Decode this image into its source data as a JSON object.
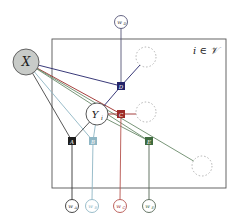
{
  "diagram": {
    "type": "factor-graph",
    "plate": {
      "label": "i ∈ 𝒱",
      "x": 52,
      "y": 39,
      "w": 174,
      "h": 149
    },
    "global_node": {
      "id": "X",
      "label": "X",
      "cx": 26,
      "cy": 62,
      "r": 13,
      "fill": "#c8cbc8"
    },
    "latent_node": {
      "id": "Y_i",
      "label": "Y",
      "sub": "i",
      "cx": 97,
      "cy": 114,
      "r": 11
    },
    "factors": [
      {
        "id": "f_A",
        "label": "A",
        "cx": 72,
        "cy": 141,
        "color": "#1e1e1e"
      },
      {
        "id": "f_B",
        "label": "B",
        "cx": 93,
        "cy": 141,
        "color": "#8fb6c4"
      },
      {
        "id": "f_C",
        "label": "C",
        "cx": 121,
        "cy": 114,
        "color": "#9c2b28"
      },
      {
        "id": "f_D",
        "label": "D",
        "cx": 121,
        "cy": 86,
        "color": "#24246a"
      },
      {
        "id": "f_E",
        "label": "E",
        "cx": 149,
        "cy": 141,
        "color": "#3f6b3f"
      }
    ],
    "weights": [
      {
        "id": "w_A",
        "label": "w",
        "sub": "A",
        "cx": 72,
        "cy": 206,
        "color": "#333333"
      },
      {
        "id": "w_B",
        "label": "w",
        "sub": "B",
        "cx": 92,
        "cy": 206,
        "color": "#8fb6c4"
      },
      {
        "id": "w_C",
        "label": "w",
        "sub": "C",
        "cx": 120,
        "cy": 206,
        "color": "#b5524d"
      },
      {
        "id": "w_D",
        "label": "w",
        "sub": "D",
        "cx": 121,
        "cy": 22,
        "color": "#555577"
      },
      {
        "id": "w_E",
        "label": "w",
        "sub": "E",
        "cx": 149,
        "cy": 206,
        "color": "#556655"
      }
    ],
    "dashed_nodes": [
      {
        "cx": 146,
        "cy": 57,
        "r": 10
      },
      {
        "cx": 146,
        "cy": 112,
        "r": 10
      },
      {
        "cx": 202,
        "cy": 166,
        "r": 10
      }
    ],
    "edges_from_X": [
      {
        "to": "f_D",
        "color": "#24246a"
      },
      {
        "to": "f_C",
        "color": "#9c2b28"
      },
      {
        "to": "f_E",
        "color": "#6a8a6a"
      },
      {
        "to": "f_A",
        "color": "#444444"
      },
      {
        "to": "f_B",
        "color": "#8fb6c4"
      }
    ]
  }
}
